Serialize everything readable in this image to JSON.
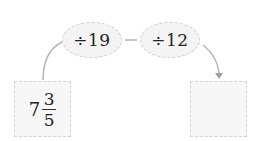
{
  "operations": [
    {
      "label": "÷19"
    },
    {
      "label": "÷12"
    }
  ],
  "start_box": {
    "whole": "7",
    "numerator": "3",
    "denominator": "5"
  },
  "result_box": {
    "value": ""
  },
  "colors": {
    "line": "#b5b5b5",
    "oval_fill": "#f4f4f4",
    "box_fill": "#f7f7f7",
    "dash_border": "#cfcfcf"
  }
}
